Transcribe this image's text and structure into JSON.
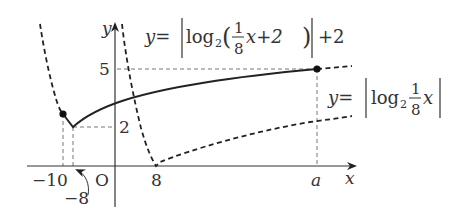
{
  "diagram": {
    "axes": {
      "x_label": "x",
      "y_label": "y",
      "origin_label": "O"
    },
    "ticks": {
      "x_minus10": "−10",
      "x_minus8": "−8",
      "x_8": "8",
      "x_a": "a",
      "y_5": "5",
      "y_2": "2"
    },
    "curves": [
      {
        "name": "upper-curve",
        "equation_prefix": "y=",
        "equation_func": "log",
        "equation_base": "2",
        "equation_frac_num": "1",
        "equation_frac_den": "8",
        "equation_inner_rest": "x+2",
        "equation_suffix": "+2",
        "style": "solid-on-interval, dashed-outside"
      },
      {
        "name": "lower-curve",
        "equation_prefix": "y=",
        "equation_func": "log",
        "equation_base": "2",
        "equation_frac_num": "1",
        "equation_frac_den": "8",
        "equation_inner_rest": "x",
        "style": "dashed"
      }
    ],
    "points": [
      {
        "label": "(-10, f(-10))",
        "x": -10
      },
      {
        "label": "(a, 5)",
        "x": "a",
        "y": 5
      }
    ],
    "colors": {
      "stroke": "#222222",
      "guide": "#777777",
      "text": "#333333"
    }
  }
}
